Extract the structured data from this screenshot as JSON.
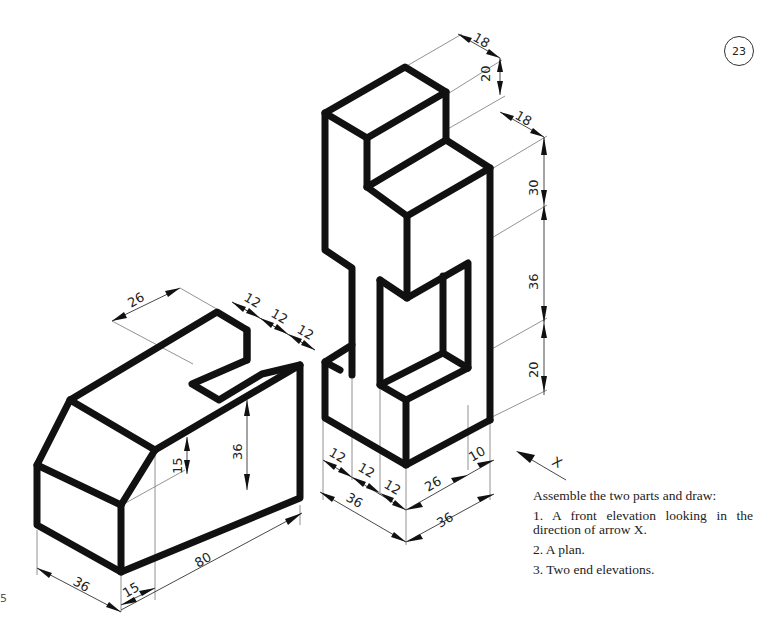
{
  "page": {
    "number": "23",
    "margin_mark": "5"
  },
  "instructions": {
    "heading": "Assemble the two parts and draw:",
    "items": [
      "1. A front elevation looking in the direction of arrow X.",
      "2. A plan.",
      "3. Two end elevations."
    ]
  },
  "arrow": {
    "label": "X"
  },
  "part_left": {
    "name": "block with chamfer and slot",
    "dimensions": {
      "slot_offset": "26",
      "slot_widths": [
        "12",
        "12",
        "12"
      ],
      "chamfer_height": "15",
      "height": "36",
      "length": "80",
      "width": "36",
      "chamfer_depth": "15"
    }
  },
  "part_right": {
    "name": "stepped upright with window",
    "dimensions": {
      "top_step_depth": "18",
      "top_step_height": "20",
      "second_step_depth": "18",
      "upper_height": "30",
      "window_height": "36",
      "base_height": "20",
      "left_widths": [
        "12",
        "12",
        "12"
      ],
      "left_total": "36",
      "right_window_width": "26",
      "right_side": "10",
      "right_total": "36"
    }
  }
}
